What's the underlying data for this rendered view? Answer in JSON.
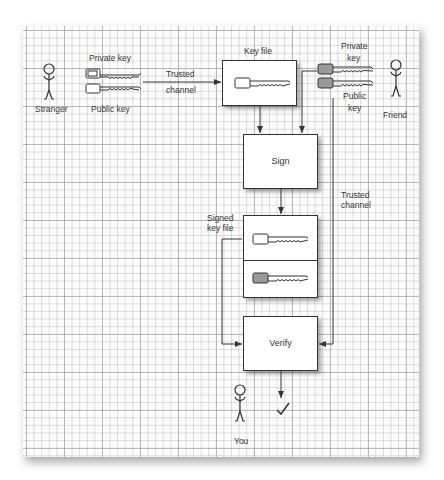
{
  "diagram": {
    "type": "flow",
    "actors": {
      "stranger": "Stranger",
      "friend": "Friend",
      "you": "You"
    },
    "labels": {
      "stranger_private_key": "Private key",
      "stranger_public_key": "Public key",
      "trusted_channel_top_line1": "Trusted",
      "trusted_channel_top_line2": "channel",
      "key_file": "Key file",
      "friend_private_key_line1": "Private",
      "friend_private_key_line2": "key",
      "friend_public_key_line1": "Public",
      "friend_public_key_line2": "key",
      "trusted_channel_right_line1": "Trusted",
      "trusted_channel_right_line2": "channel",
      "signed_key_file_line1": "Signed",
      "signed_key_file_line2": "key file"
    },
    "nodes": {
      "sign": "Sign",
      "verify": "Verify"
    },
    "result_icon": "checkmark-icon",
    "colors": {
      "line": "#333333",
      "key_fill_friend": "#9a9a9a",
      "grid_minor": "#c8c8c8",
      "grid_major": "#a8a8a8"
    }
  }
}
